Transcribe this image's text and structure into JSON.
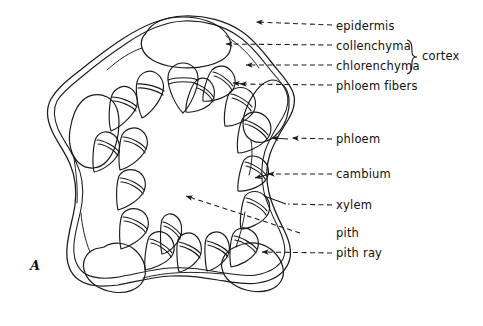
{
  "figure": {
    "panel_label": "A",
    "caption_type": "stem-cross-section-diagram",
    "ink_color": "#1a1a1a",
    "background_color": "#ffffff"
  },
  "group_brace": {
    "label": "cortex"
  },
  "labels": [
    {
      "id": "epidermis",
      "text": "epidermis",
      "text_x": 336,
      "text_y": 28,
      "line_x1": 282,
      "line_y1": 28,
      "line_x2": 332,
      "line_y2": 28,
      "arrow_x": 248,
      "arrow_y": 22,
      "lead_x": 282,
      "lead_y": 28
    },
    {
      "id": "collenchyma",
      "text": "collenchyma",
      "text_x": 336,
      "text_y": 48,
      "line_x1": 282,
      "line_y1": 48,
      "line_x2": 332,
      "line_y2": 48,
      "arrow_x": 218,
      "arrow_y": 45,
      "lead_x": 282,
      "lead_y": 48
    },
    {
      "id": "chlorenchyma",
      "text": "chlorenchyma",
      "text_x": 336,
      "text_y": 68,
      "line_x1": 282,
      "line_y1": 68,
      "line_x2": 332,
      "line_y2": 68,
      "arrow_x": 238,
      "arrow_y": 66,
      "lead_x": 282,
      "lead_y": 68
    },
    {
      "id": "phloem-fibers",
      "text": "phloem  fibers",
      "text_x": 336,
      "text_y": 90,
      "line_x1": 282,
      "line_y1": 88,
      "line_x2": 332,
      "line_y2": 88,
      "arrow_x": 234,
      "arrow_y": 84,
      "lead_x": 282,
      "lead_y": 88
    },
    {
      "id": "phloem",
      "text": "phloem",
      "text_x": 336,
      "text_y": 142,
      "line_x1": 300,
      "line_y1": 140,
      "line_x2": 332,
      "line_y2": 140,
      "arrow_x": 284,
      "arrow_y": 139,
      "lead_x": 300,
      "lead_y": 140
    },
    {
      "id": "cambium",
      "text": "cambium",
      "text_x": 336,
      "text_y": 177,
      "line_x1": 274,
      "line_y1": 175,
      "line_x2": 332,
      "line_y2": 175,
      "arrow_x": 261,
      "arrow_y": 175,
      "lead_x": 274,
      "lead_y": 175
    },
    {
      "id": "xylem",
      "text": "xylem",
      "text_x": 336,
      "text_y": 208,
      "line_x1": 286,
      "line_y1": 206,
      "line_x2": 332,
      "line_y2": 206,
      "arrow_x": 256,
      "arrow_y": 200,
      "lead_x": 286,
      "lead_y": 206
    },
    {
      "id": "pith",
      "text": "pith",
      "text_x": 336,
      "text_y": 236,
      "line_x1": 268,
      "line_y1": 234,
      "line_x2": 332,
      "line_y2": 234,
      "arrow_x": 178,
      "arrow_y": 192,
      "lead_x": 268,
      "lead_y": 234
    },
    {
      "id": "pith-ray",
      "text": "pith ray",
      "text_x": 336,
      "text_y": 256,
      "line_x1": 282,
      "line_y1": 254,
      "line_x2": 332,
      "line_y2": 254,
      "arrow_x": 255,
      "arrow_y": 252,
      "lead_x": 282,
      "lead_y": 254
    }
  ],
  "structures": {
    "vascular_bundle_count": 18,
    "ridge_lobe_count": 5,
    "parts_per_bundle": [
      "phloem fibers cap",
      "phloem",
      "cambium",
      "xylem"
    ]
  }
}
